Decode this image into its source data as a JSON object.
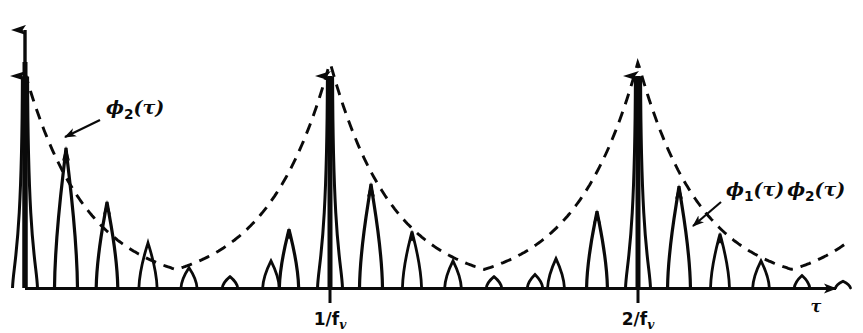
{
  "figure": {
    "kind": "line",
    "background_color": "#ffffff",
    "ink_color": "#0a0a0a"
  },
  "axes": {
    "x_axis_label": "τ",
    "x_axis_label_name": "tau",
    "y_axis_label": "",
    "x_ticks": [
      {
        "label_main": "1/f",
        "label_sub": "v",
        "position_px": 330
      },
      {
        "label_main": "2/f",
        "label_sub": "v",
        "position_px": 638
      }
    ],
    "origin_px": {
      "x": 25,
      "y": 288
    },
    "x_axis_end_px": 848,
    "y_axis_top_px": 16,
    "has_x_arrow": true,
    "has_y_arrow": true
  },
  "annotations": [
    {
      "id": "phi2",
      "text_main": "ϕ",
      "text_sub": "2",
      "text_arg": "(τ)",
      "full_text": "ϕ2(τ)",
      "text_x": 106,
      "text_y": 114,
      "leader_from": {
        "x": 100,
        "y": 120
      },
      "leader_to": {
        "x": 61,
        "y": 139
      }
    },
    {
      "id": "phi1phi2",
      "text_main": "ϕ",
      "text_sub": "1",
      "text_arg": "(τ)",
      "text_main2": "ϕ",
      "text_sub2": "2",
      "text_arg2": "(τ)",
      "full_text": "ϕ1(τ)ϕ2(τ)",
      "text_x": 726,
      "text_y": 196,
      "leader_from": {
        "x": 721,
        "y": 202
      },
      "leader_to": {
        "x": 690,
        "y": 228
      }
    }
  ],
  "chart_data": {
    "type": "line",
    "title": "",
    "subtitle": "",
    "xlabel": "τ",
    "ylabel": "",
    "grid": false,
    "legend": "none",
    "xlim": [
      0,
      3.05
    ],
    "ylim": [
      0,
      1.0
    ],
    "xtick_values": [
      1,
      2
    ],
    "xtick_labels": [
      "1/f_v",
      "2/f_v"
    ],
    "ytick_values": [],
    "ytick_labels": [],
    "series": [
      {
        "name": "ϕ1(τ)ϕ2(τ)",
        "style": "solid-impulse-train",
        "description": "Narrow positive impulses at uniform spacing, amplitude set by the envelope",
        "impulse_spacing_units": 0.1333,
        "impulse_positions_px": [
          25,
          66,
          107,
          148,
          189,
          230,
          271,
          289,
          330,
          371,
          412,
          453,
          494,
          535,
          556,
          597,
          638,
          679,
          720,
          761,
          802,
          843
        ],
        "peak_amplitudes_normalized": [
          1.0,
          0.62,
          0.38,
          0.2,
          0.09,
          0.05,
          0.12,
          0.26,
          1.0,
          0.46,
          0.25,
          0.12,
          0.05,
          0.06,
          0.13,
          0.34,
          1.0,
          0.45,
          0.24,
          0.12,
          0.055,
          0.03
        ]
      },
      {
        "name": "ϕ2(τ)",
        "style": "dashed-envelope",
        "description": "Dashed exponentially decaying envelope, periodic with period 1/f_v, peaking at τ = 0, 1/f_v, 2/f_v",
        "envelope_period_units": 1.0,
        "envelope_peaks_at": [
          0,
          1,
          2
        ],
        "envelope_peak_value": 1.0,
        "envelope_min_value": 0.02
      }
    ]
  }
}
